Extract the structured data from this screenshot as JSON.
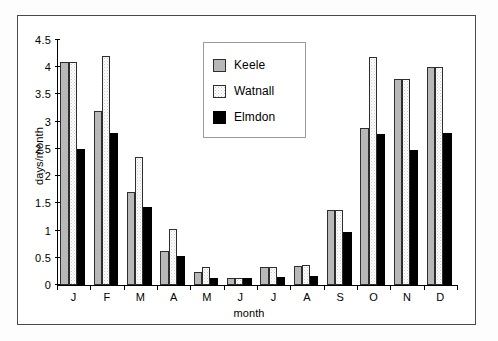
{
  "chart_data": {
    "type": "bar",
    "title": "",
    "xlabel": "month",
    "ylabel": "days/month",
    "ylim": [
      0,
      4.5
    ],
    "yticks": [
      "0",
      "0.5",
      "1",
      "1.5",
      "2",
      "2.5",
      "3",
      "3.5",
      "4",
      "4.5"
    ],
    "ytick_values": [
      0,
      0.5,
      1,
      1.5,
      2,
      2.5,
      3,
      3.5,
      4,
      4.5
    ],
    "grid": false,
    "legend_position": "upper-center",
    "categories": [
      "J",
      "F",
      "M",
      "A",
      "M",
      "J",
      "J",
      "A",
      "S",
      "O",
      "N",
      "D"
    ],
    "series": [
      {
        "name": "Keele",
        "color": "#b8b8b8",
        "values": [
          4.1,
          3.2,
          1.7,
          0.63,
          0.23,
          0.12,
          0.34,
          0.35,
          1.37,
          2.88,
          3.78,
          4.0
        ]
      },
      {
        "name": "Watnall",
        "color": "#ffffff",
        "values": [
          4.1,
          4.2,
          2.35,
          1.03,
          0.34,
          0.12,
          0.34,
          0.36,
          1.37,
          4.18,
          3.78,
          4.0
        ]
      },
      {
        "name": "Elmdon",
        "color": "#000000",
        "values": [
          2.5,
          2.8,
          1.43,
          0.53,
          0.13,
          0.13,
          0.15,
          0.16,
          0.98,
          2.78,
          2.48,
          2.8
        ]
      }
    ]
  },
  "legend": {
    "items": [
      {
        "label": "Keele",
        "swatch": "keele"
      },
      {
        "label": "Watnall",
        "swatch": "watnall"
      },
      {
        "label": "Elmdon",
        "swatch": "elmdon"
      }
    ]
  }
}
